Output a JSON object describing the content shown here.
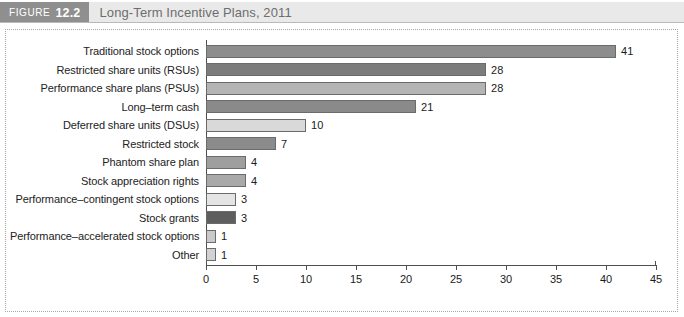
{
  "header": {
    "tag_word": "FIGURE",
    "tag_number": "12.2",
    "title": "Long-Term Incentive Plans, 2011"
  },
  "chart_data": {
    "type": "bar",
    "orientation": "horizontal",
    "title": "Long-Term Incentive Plans, 2011",
    "xlabel": "",
    "ylabel": "",
    "xlim": [
      0,
      45
    ],
    "grid": false,
    "legend": null,
    "xticks": [
      "0",
      "5",
      "10",
      "15",
      "20",
      "25",
      "30",
      "35",
      "40",
      "45"
    ],
    "xtick_values": [
      0,
      5,
      10,
      15,
      20,
      25,
      30,
      35,
      40,
      45
    ],
    "categories": [
      "Traditional stock options",
      "Restricted share units (RSUs)",
      "Performance share plans (PSUs)",
      "Long–term cash",
      "Deferred share units (DSUs)",
      "Restricted stock",
      "Phantom share plan",
      "Stock appreciation rights",
      "Performance–contingent stock options",
      "Stock grants",
      "Performance–accelerated stock options",
      "Other"
    ],
    "values": [
      41,
      28,
      28,
      21,
      10,
      7,
      4,
      4,
      3,
      3,
      1,
      1
    ],
    "value_labels": [
      "41",
      "28",
      "28",
      "21",
      "10",
      "7",
      "4",
      "4",
      "3",
      "3",
      "1",
      "1"
    ],
    "bar_colors": [
      "#8d8d8d",
      "#7c7c7c",
      "#b4b4b4",
      "#8a8a8a",
      "#d9d9d9",
      "#8b8b8b",
      "#9e9e9e",
      "#a9a9a9",
      "#e4e4e4",
      "#5e5e5e",
      "#c9c9c9",
      "#d2d2d2"
    ]
  },
  "colors": {
    "header_band": "#e9e9e9",
    "header_tag": "#8f8f8f",
    "title_text": "#6d6d6d",
    "axis": "#4f4f4f",
    "frame_border": "#a8a8a8",
    "plot_background": "#ffffff"
  }
}
